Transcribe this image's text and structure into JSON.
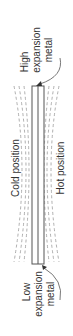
{
  "diagram": {
    "type": "bimetallic-strip",
    "orientation": "rotated-90",
    "labels": {
      "high_line1": "High",
      "high_line2": "expansion",
      "high_line3": "metal",
      "low_line1": "Low",
      "low_line2": "expansion",
      "low_line3": "metal",
      "cold": "Cold position",
      "hot": "Hot position"
    },
    "colors": {
      "strip_outline": "#555555",
      "dashed": "#999999",
      "text": "#333333"
    }
  }
}
